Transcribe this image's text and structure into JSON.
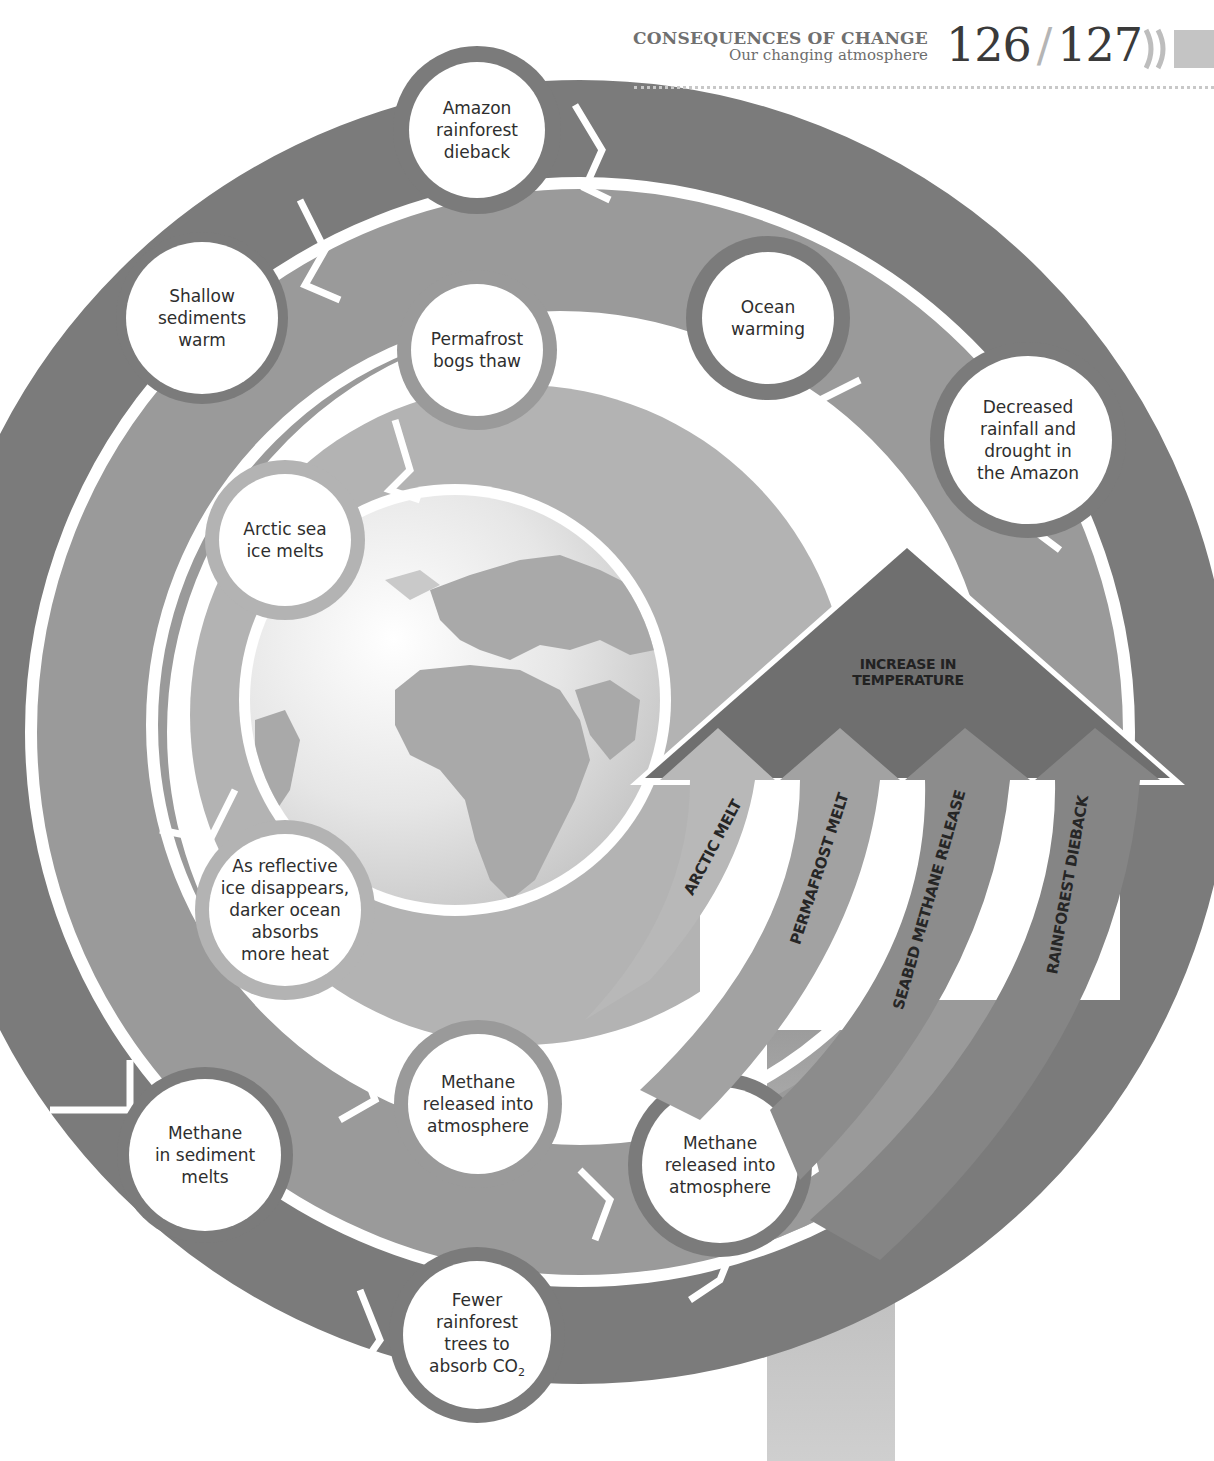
{
  "header": {
    "section_title": "CONSEQUENCES OF CHANGE",
    "subtitle": "Our changing atmosphere",
    "page_left": "126",
    "page_separator": "/",
    "page_right": "127",
    "chevron_icon": "double-chevron-right-icon"
  },
  "colors": {
    "outer_ring": "#7b7b7b",
    "middle_ring": "#999999",
    "inner_ring": "#b3b3b3",
    "globe_ocean": "#e9e9e9",
    "globe_land": "#a8a8a8",
    "temperature_arrow": "#6f6f6f",
    "arrow_arctic": "#b8b8b8",
    "arrow_permafrost": "#a2a2a2",
    "arrow_seabed": "#8c8c8c",
    "arrow_rainforest": "#858585",
    "stem_bar": "#bdbdbd",
    "node_fill": "#ffffff",
    "text": "#2e2e2e"
  },
  "nodes": {
    "amazon_dieback": [
      "Amazon",
      "rainforest",
      "dieback"
    ],
    "shallow_sediments": [
      "Shallow",
      "sediments",
      "warm"
    ],
    "permafrost_bogs": [
      "Permafrost",
      "bogs thaw"
    ],
    "ocean_warming": [
      "Ocean",
      "warming"
    ],
    "decreased_rainfall": [
      "Decreased",
      "rainfall and",
      "drought in",
      "the Amazon"
    ],
    "arctic_sea_ice": [
      "Arctic sea",
      "ice melts"
    ],
    "reflective_ice": [
      "As reflective",
      "ice disappears,",
      "darker ocean",
      "absorbs",
      "more heat"
    ],
    "methane_inner": [
      "Methane",
      "released into",
      "atmosphere"
    ],
    "methane_sediment": [
      "Methane",
      "in sediment",
      "melts"
    ],
    "methane_seabed": [
      "Methane",
      "released into",
      "atmosphere"
    ],
    "fewer_trees_prefix": [
      "Fewer",
      "rainforest",
      "trees to"
    ],
    "fewer_trees_last": "absorb CO",
    "fewer_trees_sub": "2"
  },
  "temperature": {
    "line1": "INCREASE IN",
    "line2": "TEMPERATURE"
  },
  "feedback_arrows": {
    "arctic": "ARCTIC MELT",
    "permafrost": "PERMAFROST MELT",
    "seabed": "SEABED METHANE RELEASE",
    "rainforest": "RAINFOREST DIEBACK"
  }
}
